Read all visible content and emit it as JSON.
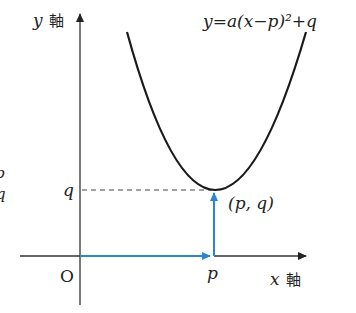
{
  "diagram": {
    "equation": "y=a(x−p)²+q",
    "y_axis_label_var": "y",
    "y_axis_label_word": "軸",
    "x_axis_label_var": "x",
    "x_axis_label_word": "軸",
    "origin_label": "O",
    "p_label": "p",
    "q_label": "q",
    "vertex_label": "(p, q)",
    "edge_fragments": [
      "p",
      "q"
    ],
    "colors": {
      "curve": "#1a1a1a",
      "axes": "#333333",
      "arrows": "#2a86d1",
      "dashed": "#444444"
    }
  }
}
